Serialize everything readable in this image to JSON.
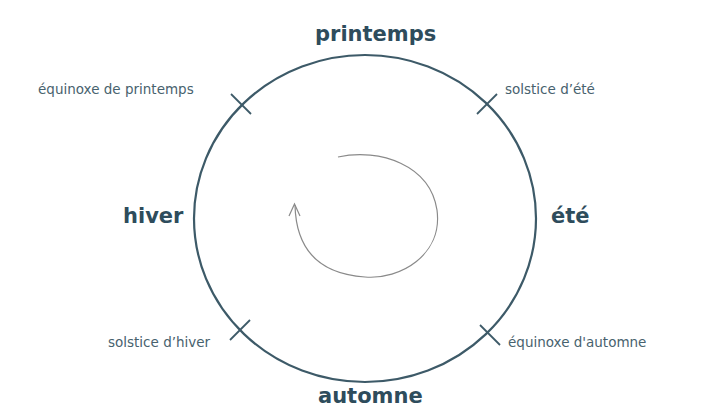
{
  "diagram": {
    "colors": {
      "circle": "#3d5a68",
      "season_text": "#2e4c5c",
      "event_text": "#48626e",
      "spiral": "#8a8a8a"
    },
    "seasons": {
      "top": "printemps",
      "right": "été",
      "bottom": "automne",
      "left": "hiver"
    },
    "events": {
      "top_left": "équinoxe de printemps",
      "top_right": "solstice d’été",
      "bottom_left": "solstice d’hiver",
      "bottom_right": "équinoxe d'automne"
    },
    "center_icon": "clockwise-spiral-arrow-icon"
  }
}
